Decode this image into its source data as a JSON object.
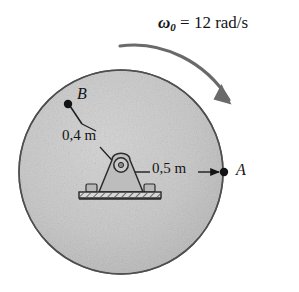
{
  "figure": {
    "background_color": "#ffffff",
    "disk_fill": "#c6c6c6",
    "disk_stroke": "#585858",
    "ink_color": "#141414"
  },
  "annotations": {
    "angular_velocity": {
      "symbol": "ω",
      "subscript": "0",
      "equals": "=",
      "value": "12",
      "units": "rad/s",
      "full_text": "ω₀ = 12 rad/s"
    },
    "point_b": {
      "label": "B",
      "radius_label": "0,4 m"
    },
    "point_a": {
      "label": "A",
      "radius_label": "0,5 m"
    }
  },
  "icons": {
    "rotation_arrow": "curved-arrow-clockwise-icon",
    "bearing": "pin-bearing-support-icon",
    "base": "hatched-ground-base-icon",
    "point_marker": "filled-dot-icon"
  },
  "geometry": {
    "disk_center_x": 121,
    "disk_center_y": 172,
    "disk_radius": 102
  }
}
